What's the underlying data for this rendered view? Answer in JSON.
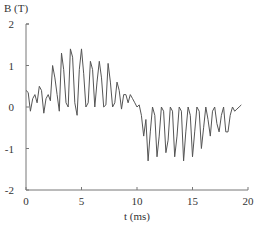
{
  "chart_data": {
    "type": "line",
    "title": "",
    "xlabel": "t (ms)",
    "ylabel": "B (T)",
    "xlim": [
      0,
      20
    ],
    "ylim": [
      -2,
      2
    ],
    "xticks": [
      "0",
      "5",
      "10",
      "15",
      "20"
    ],
    "yticks": [
      "2",
      "1",
      "0",
      "-1",
      "-2"
    ],
    "grid": false,
    "legend": null,
    "series": [
      {
        "name": "B",
        "color": "#555555",
        "x": [
          0.0,
          0.2,
          0.4,
          0.6,
          0.8,
          1.0,
          1.2,
          1.4,
          1.6,
          1.8,
          2.0,
          2.2,
          2.4,
          2.6,
          2.8,
          3.0,
          3.2,
          3.4,
          3.6,
          3.8,
          4.0,
          4.2,
          4.4,
          4.6,
          4.8,
          5.0,
          5.2,
          5.4,
          5.6,
          5.8,
          6.0,
          6.2,
          6.4,
          6.6,
          6.8,
          7.0,
          7.2,
          7.4,
          7.6,
          7.8,
          8.0,
          8.2,
          8.4,
          8.6,
          8.8,
          9.0,
          9.2,
          9.4,
          9.6,
          9.8,
          10.0,
          10.2,
          10.4,
          10.6,
          10.8,
          11.0,
          11.2,
          11.4,
          11.6,
          11.8,
          12.0,
          12.2,
          12.4,
          12.6,
          12.8,
          13.0,
          13.2,
          13.4,
          13.6,
          13.8,
          14.0,
          14.2,
          14.4,
          14.6,
          14.8,
          15.0,
          15.2,
          15.4,
          15.6,
          15.8,
          16.0,
          16.2,
          16.4,
          16.6,
          16.8,
          17.0,
          17.2,
          17.4,
          17.6,
          17.8,
          18.0,
          18.2,
          18.4,
          18.6,
          18.8,
          19.0,
          19.2,
          19.4
        ],
        "values": [
          0.4,
          0.35,
          -0.1,
          0.2,
          0.3,
          0.1,
          0.5,
          0.4,
          -0.15,
          0.2,
          0.3,
          0.15,
          1.0,
          0.7,
          0.3,
          -0.1,
          1.3,
          0.9,
          0.1,
          0.0,
          1.4,
          1.2,
          0.1,
          -0.2,
          0.9,
          1.4,
          0.8,
          0.0,
          0.1,
          1.1,
          0.9,
          0.0,
          0.6,
          1.1,
          0.7,
          0.0,
          0.05,
          1.05,
          0.6,
          0.0,
          0.1,
          0.6,
          0.4,
          -0.05,
          0.3,
          0.3,
          0.1,
          0.3,
          0.2,
          0.1,
          0.0,
          0.05,
          -0.2,
          -0.7,
          -0.3,
          -1.3,
          -0.6,
          0.0,
          -0.2,
          -1.2,
          -0.7,
          0.0,
          -0.1,
          -1.1,
          -0.8,
          0.0,
          -0.1,
          -1.2,
          -0.7,
          0.0,
          -0.1,
          -1.3,
          -0.6,
          0.0,
          -0.2,
          -1.2,
          -0.6,
          0.0,
          -0.1,
          -1.0,
          -0.5,
          0.0,
          -0.3,
          -0.7,
          -0.1,
          0.0,
          -0.4,
          -0.6,
          -0.2,
          0.0,
          -0.6,
          -0.6,
          -0.2,
          0.0,
          -0.1,
          -0.05,
          0.0,
          0.05
        ]
      }
    ]
  }
}
